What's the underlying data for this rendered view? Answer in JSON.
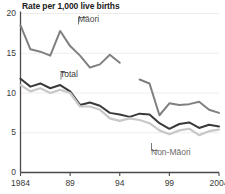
{
  "chart_data": {
    "type": "line",
    "title": "Rate per 1,000 live births",
    "xlabel": "",
    "ylabel": "",
    "ylim": [
      0,
      20
    ],
    "xlim": [
      1984,
      2004
    ],
    "grid": true,
    "grid_axis": "y",
    "legend": "inline-annotations",
    "yticks": [
      0,
      5,
      10,
      15,
      20
    ],
    "ytick_labels": [
      "0",
      "5",
      "10",
      "15",
      "20"
    ],
    "xticks": [
      1984,
      1989,
      1994,
      1999,
      2004
    ],
    "xtick_labels": [
      "1984",
      "89",
      "94",
      "99",
      "2004"
    ],
    "x": [
      1984,
      1985,
      1986,
      1987,
      1988,
      1989,
      1990,
      1991,
      1992,
      1993,
      1994,
      1995,
      1996,
      1997,
      1998,
      1999,
      2000,
      2001,
      2002,
      2003,
      2004
    ],
    "series": [
      {
        "name": "Maori",
        "label": "Māori",
        "color": "#808080",
        "width": 2.0,
        "x": [
          1984,
          1985,
          1986,
          1987,
          1988,
          1989,
          1990,
          1991,
          1992,
          1993,
          1994
        ],
        "values": [
          18.5,
          15.5,
          15.2,
          14.7,
          17.8,
          15.9,
          14.7,
          13.2,
          13.6,
          14.8,
          13.8
        ]
      },
      {
        "name": "Maori-continued",
        "label": "Māori",
        "color": "#808080",
        "width": 2.0,
        "x": [
          1996,
          1997,
          1998,
          1999,
          2000,
          2001,
          2002,
          2003,
          2004
        ],
        "values": [
          11.7,
          11.2,
          7.2,
          8.7,
          8.5,
          8.6,
          8.9,
          7.9,
          7.5
        ]
      },
      {
        "name": "Total",
        "label": "Total",
        "color": "#3a3a3a",
        "width": 2.0,
        "x": [
          1984,
          1985,
          1986,
          1987,
          1988,
          1989,
          1990,
          1991,
          1992,
          1993,
          1994,
          1995,
          1996,
          1997,
          1998,
          1999,
          2000,
          2001,
          2002,
          2003,
          2004
        ],
        "values": [
          11.8,
          10.8,
          11.2,
          10.6,
          11.0,
          10.2,
          8.5,
          8.8,
          8.4,
          7.5,
          7.3,
          7.0,
          7.4,
          7.3,
          6.2,
          5.5,
          6.1,
          6.3,
          5.6,
          6.0,
          5.8
        ]
      },
      {
        "name": "Non-Maori",
        "label": "Non-Māori",
        "color": "#c8c8c8",
        "width": 2.2,
        "x": [
          1984,
          1985,
          1986,
          1987,
          1988,
          1989,
          1990,
          1991,
          1992,
          1993,
          1994,
          1995,
          1996,
          1997,
          1998,
          1999,
          2000,
          2001,
          2002,
          2003,
          2004
        ],
        "values": [
          11.0,
          10.2,
          10.6,
          10.0,
          10.4,
          10.0,
          8.3,
          8.3,
          7.9,
          6.8,
          6.5,
          6.8,
          6.6,
          6.2,
          5.3,
          4.8,
          5.3,
          5.5,
          4.7,
          5.2,
          5.4
        ]
      }
    ],
    "annotations": [
      {
        "name": "maori-label",
        "text": "Māori"
      },
      {
        "name": "total-label",
        "text": "Total"
      },
      {
        "name": "nonmaori-label",
        "text": "Non-Māori"
      }
    ]
  }
}
